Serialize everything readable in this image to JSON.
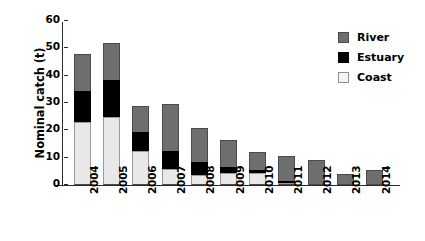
{
  "chart_data": {
    "type": "bar",
    "subtype": "stacked-vertical",
    "title": "",
    "xlabel": "",
    "ylabel": "Nominal catch (t)",
    "categories": [
      "2004",
      "2005",
      "2006",
      "2007",
      "2008",
      "2009",
      "2010",
      "2011",
      "2012",
      "2013",
      "2014"
    ],
    "ylim": [
      0,
      60
    ],
    "yticks": [
      0,
      10,
      20,
      30,
      40,
      50,
      60
    ],
    "ytick_labels": [
      "0",
      "10",
      "20",
      "30",
      "40",
      "50",
      "60"
    ],
    "grid": false,
    "legend_position": "top-right",
    "stack_order_bottom_to_top": [
      "Coast",
      "Estuary",
      "River"
    ],
    "series": [
      {
        "name": "Coast",
        "color": "#e8e8e8",
        "values": [
          23,
          25,
          12.5,
          6,
          3.5,
          4.5,
          4.5,
          0.5,
          0,
          0,
          0
        ]
      },
      {
        "name": "Estuary",
        "color": "#000000",
        "values": [
          11.5,
          13.5,
          7,
          6.5,
          5,
          2,
          1,
          0.7,
          0,
          0,
          0
        ]
      },
      {
        "name": "River",
        "color": "#6e6e6e",
        "values": [
          13.5,
          13.5,
          9.5,
          17,
          12.5,
          10,
          6.5,
          9.3,
          9,
          4,
          5.5
        ]
      }
    ],
    "totals": [
      48,
      52,
      29,
      29.5,
      21,
      16.5,
      12,
      10.5,
      9,
      4,
      5.5
    ]
  },
  "legend": {
    "items": [
      {
        "label": "River",
        "color": "#6e6e6e"
      },
      {
        "label": "Estuary",
        "color": "#000000"
      },
      {
        "label": "Coast",
        "color": "#f4f4f4"
      }
    ]
  }
}
